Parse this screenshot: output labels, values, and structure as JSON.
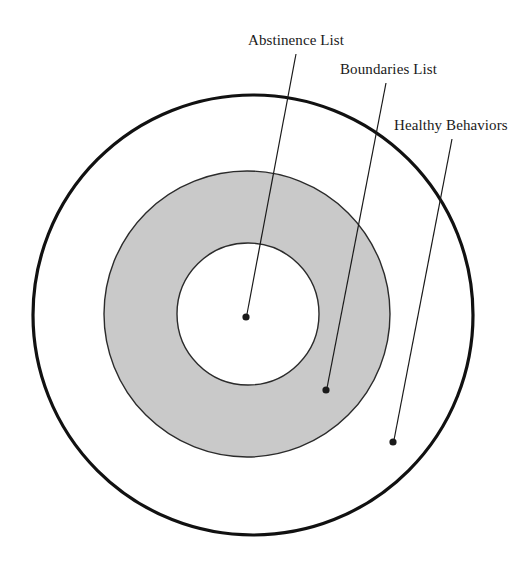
{
  "diagram": {
    "type": "concentric-circles",
    "background_color": "#ffffff",
    "rings": [
      {
        "id": "outer",
        "label": "Healthy Behaviors",
        "fill_color": "#ffffff",
        "stroke_color": "#111111",
        "stroke_width": 3.2,
        "cx": 253,
        "cy": 315,
        "r": 220,
        "order": 3
      },
      {
        "id": "middle",
        "label": "Boundaries List",
        "fill_color": "#c9c9c9",
        "stroke_color": "#2b2b2b",
        "stroke_width": 1.4,
        "cx": 247,
        "cy": 314,
        "r": 143,
        "order": 2
      },
      {
        "id": "inner",
        "label": "Abstinence List",
        "fill_color": "#ffffff",
        "stroke_color": "#2b2b2b",
        "stroke_width": 1.4,
        "cx": 248,
        "cy": 314,
        "r": 71,
        "order": 1
      }
    ],
    "callouts": [
      {
        "id": "abstinence",
        "label": "Abstinence List",
        "text_x": 248,
        "text_y": 45,
        "text_anchor": "start",
        "line_x1": 296,
        "line_y1": 54,
        "line_x2": 247,
        "line_y2": 314,
        "dot_x": 246,
        "dot_y": 317,
        "dot_r": 3.6,
        "color": "#1a1a1a"
      },
      {
        "id": "boundaries",
        "label": "Boundaries List",
        "text_x": 340,
        "text_y": 74,
        "text_anchor": "start",
        "line_x1": 386,
        "line_y1": 83,
        "line_x2": 327,
        "line_y2": 388,
        "dot_x": 326,
        "dot_y": 390,
        "dot_r": 3.6,
        "color": "#1a1a1a"
      },
      {
        "id": "healthy",
        "label": "Healthy Behaviors",
        "text_x": 394,
        "text_y": 130,
        "text_anchor": "start",
        "line_x1": 452,
        "line_y1": 139,
        "line_x2": 394,
        "line_y2": 440,
        "dot_x": 393,
        "dot_y": 442,
        "dot_r": 3.6,
        "color": "#1a1a1a"
      }
    ]
  }
}
